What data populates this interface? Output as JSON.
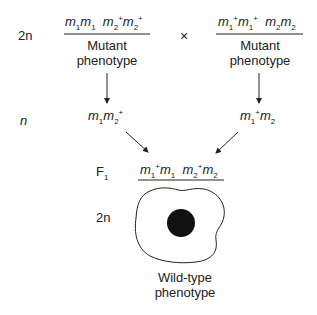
{
  "rows": {
    "top_ploidy": "2n",
    "middle_ploidy": "n",
    "f1_label": "F",
    "f1_sub": "1",
    "bottom_ploidy": "2n"
  },
  "cross_symbol": "×",
  "parent_left": {
    "genotype": [
      {
        "base": "m",
        "sub": "1",
        "sup": ""
      },
      {
        "base": "m",
        "sub": "1",
        "sup": ""
      },
      {
        "base": "m",
        "sub": "2",
        "sup": "+"
      },
      {
        "base": "m",
        "sub": "2",
        "sup": "+"
      }
    ],
    "phenotype_line1": "Mutant",
    "phenotype_line2": "phenotype"
  },
  "parent_right": {
    "genotype": [
      {
        "base": "m",
        "sub": "1",
        "sup": "+"
      },
      {
        "base": "m",
        "sub": "1",
        "sup": "+"
      },
      {
        "base": "m",
        "sub": "2",
        "sup": ""
      },
      {
        "base": "m",
        "sub": "2",
        "sup": ""
      }
    ],
    "phenotype_line1": "Mutant",
    "phenotype_line2": "phenotype"
  },
  "gamete_left": [
    {
      "base": "m",
      "sub": "1",
      "sup": ""
    },
    {
      "base": "m",
      "sub": "2",
      "sup": "+"
    }
  ],
  "gamete_right": [
    {
      "base": "m",
      "sub": "1",
      "sup": "+"
    },
    {
      "base": "m",
      "sub": "2",
      "sup": ""
    }
  ],
  "f1_genotype": [
    {
      "base": "m",
      "sub": "1",
      "sup": "+"
    },
    {
      "base": "m",
      "sub": "1",
      "sup": ""
    },
    {
      "base": "m",
      "sub": "2",
      "sup": "+"
    },
    {
      "base": "m",
      "sub": "2",
      "sup": ""
    }
  ],
  "f1_phenotype_line1": "Wild-type",
  "f1_phenotype_line2": "phenotype",
  "colors": {
    "ink": "#222222",
    "nucleus": "#111111",
    "background": "#ffffff"
  }
}
